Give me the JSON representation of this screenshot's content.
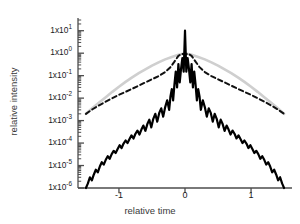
{
  "figure": {
    "background": "#ffffff",
    "axis_color": "#4d4d4d"
  },
  "axes": {
    "xlabel": "relative time",
    "ylabel": "relative intensity",
    "xticks": [
      {
        "value": -1,
        "label": "-1"
      },
      {
        "value": 0,
        "label": "0"
      },
      {
        "value": 1,
        "label": "1"
      }
    ],
    "yticks": [
      {
        "exp": 1,
        "mantissa": "1x10",
        "label": "1x10",
        "sup": "1"
      },
      {
        "exp": 0,
        "mantissa": "1x10",
        "label": "1x10",
        "sup": "0"
      },
      {
        "exp": -1,
        "mantissa": "1x10",
        "label": "1x10",
        "sup": "-1"
      },
      {
        "exp": -2,
        "mantissa": "1x10",
        "label": "1x10",
        "sup": "-2"
      },
      {
        "exp": -3,
        "mantissa": "1x10",
        "label": "1x10",
        "sup": "-3"
      },
      {
        "exp": -4,
        "mantissa": "1x10",
        "label": "1x10",
        "sup": "-4"
      },
      {
        "exp": -5,
        "mantissa": "1x10",
        "label": "1x10",
        "sup": "-5"
      },
      {
        "exp": -6,
        "mantissa": "1x10",
        "label": "1x10",
        "sup": "-6"
      }
    ]
  },
  "chart_data": {
    "type": "line",
    "title": "",
    "xlabel": "relative time",
    "ylabel": "relative intensity",
    "xlim": [
      -1.62,
      1.62
    ],
    "ylim": [
      1e-06,
      30
    ],
    "yscale": "log",
    "xscale": "linear",
    "grid": false,
    "legend": false,
    "series": [
      {
        "name": "gray-envelope",
        "style": "solid",
        "color": "#cfcfcf",
        "width": 2.6,
        "comment": "smooth broad gaussian-like envelope peaking at ~1 near t=0",
        "x": [
          -1.5,
          -1.4,
          -1.3,
          -1.2,
          -1.1,
          -1.0,
          -0.9,
          -0.8,
          -0.7,
          -0.6,
          -0.5,
          -0.4,
          -0.3,
          -0.2,
          -0.1,
          0.0,
          0.1,
          0.2,
          0.3,
          0.4,
          0.5,
          0.6,
          0.7,
          0.8,
          0.9,
          1.0,
          1.1,
          1.2,
          1.3,
          1.4,
          1.5
        ],
        "y": [
          0.002,
          0.0036,
          0.0064,
          0.011,
          0.019,
          0.032,
          0.053,
          0.084,
          0.13,
          0.19,
          0.28,
          0.39,
          0.53,
          0.68,
          0.85,
          1.0,
          0.85,
          0.68,
          0.53,
          0.39,
          0.28,
          0.19,
          0.13,
          0.084,
          0.053,
          0.032,
          0.019,
          0.011,
          0.0064,
          0.0036,
          0.002
        ]
      },
      {
        "name": "dashed-envelope",
        "style": "dashed",
        "color": "#111111",
        "width": 2.0,
        "comment": "dashed curve, flatter in wings than gray, peaks ~1 with a shallow dip at center",
        "x": [
          -1.5,
          -1.4,
          -1.3,
          -1.2,
          -1.1,
          -1.0,
          -0.9,
          -0.8,
          -0.7,
          -0.6,
          -0.5,
          -0.4,
          -0.3,
          -0.22,
          -0.16,
          -0.1,
          -0.05,
          0.0,
          0.05,
          0.1,
          0.16,
          0.22,
          0.3,
          0.4,
          0.5,
          0.6,
          0.7,
          0.8,
          0.9,
          1.0,
          1.1,
          1.2,
          1.3,
          1.4,
          1.5
        ],
        "y": [
          0.002,
          0.0032,
          0.0048,
          0.007,
          0.01,
          0.014,
          0.019,
          0.026,
          0.036,
          0.05,
          0.069,
          0.095,
          0.145,
          0.24,
          0.42,
          0.76,
          0.95,
          0.86,
          0.95,
          0.76,
          0.42,
          0.24,
          0.145,
          0.095,
          0.069,
          0.05,
          0.036,
          0.026,
          0.019,
          0.014,
          0.01,
          0.007,
          0.0048,
          0.0032,
          0.002
        ]
      },
      {
        "name": "measured-pulse",
        "style": "solid",
        "color": "#000000",
        "width": 2.2,
        "comment": "jagged oscillating trace with deep nulls; central spike reaches ~1x10^1",
        "x": [
          -1.5,
          -1.47,
          -1.44,
          -1.41,
          -1.38,
          -1.35,
          -1.32,
          -1.29,
          -1.26,
          -1.23,
          -1.2,
          -1.17,
          -1.14,
          -1.11,
          -1.08,
          -1.05,
          -1.02,
          -0.99,
          -0.96,
          -0.93,
          -0.9,
          -0.87,
          -0.84,
          -0.81,
          -0.78,
          -0.75,
          -0.72,
          -0.69,
          -0.66,
          -0.63,
          -0.6,
          -0.57,
          -0.54,
          -0.51,
          -0.48,
          -0.45,
          -0.42,
          -0.39,
          -0.36,
          -0.33,
          -0.3,
          -0.27,
          -0.24,
          -0.22,
          -0.2,
          -0.18,
          -0.16,
          -0.14,
          -0.12,
          -0.1,
          -0.08,
          -0.06,
          -0.04,
          -0.02,
          0.0,
          0.02,
          0.04,
          0.06,
          0.08,
          0.1,
          0.12,
          0.14,
          0.16,
          0.18,
          0.2,
          0.22,
          0.24,
          0.27,
          0.3,
          0.33,
          0.36,
          0.39,
          0.42,
          0.45,
          0.48,
          0.51,
          0.54,
          0.57,
          0.6,
          0.63,
          0.66,
          0.69,
          0.72,
          0.75,
          0.78,
          0.81,
          0.84,
          0.87,
          0.9,
          0.93,
          0.96,
          0.99,
          1.02,
          1.05,
          1.08,
          1.11,
          1.14,
          1.17,
          1.2,
          1.23,
          1.26,
          1.29,
          1.32,
          1.35,
          1.38,
          1.41,
          1.44,
          1.47,
          1.5
        ],
        "y": [
          1e-06,
          1.6e-06,
          3e-06,
          2.2e-06,
          4e-06,
          6.5e-06,
          5e-06,
          9e-06,
          1.4e-05,
          1.1e-05,
          1.8e-05,
          2.6e-05,
          2e-05,
          3.2e-05,
          4.5e-05,
          3.6e-05,
          5.5e-05,
          8e-05,
          6e-05,
          9.5e-05,
          0.00013,
          0.0001,
          0.00015,
          0.00022,
          0.00016,
          0.00026,
          0.00036,
          0.00024,
          0.0004,
          0.0006,
          0.00035,
          0.0007,
          0.0011,
          0.0005,
          0.0012,
          0.002,
          0.0009,
          0.0022,
          0.0035,
          0.0015,
          0.004,
          0.008,
          0.003,
          0.012,
          0.025,
          0.008,
          0.04,
          0.15,
          0.03,
          0.33,
          0.05,
          0.2,
          0.6,
          0.15,
          10.0,
          0.15,
          0.6,
          0.2,
          0.05,
          0.33,
          0.03,
          0.15,
          0.04,
          0.008,
          0.025,
          0.012,
          0.003,
          0.008,
          0.004,
          0.0015,
          0.0035,
          0.0022,
          0.0009,
          0.002,
          0.0012,
          0.0005,
          0.0011,
          0.0007,
          0.00035,
          0.0006,
          0.0004,
          0.00024,
          0.00036,
          0.00026,
          0.00016,
          0.00022,
          0.00015,
          0.0001,
          0.00013,
          9.5e-05,
          6e-05,
          8e-05,
          5.5e-05,
          3.6e-05,
          4.5e-05,
          3.2e-05,
          2e-05,
          2.6e-05,
          1.8e-05,
          1.1e-05,
          1.4e-05,
          9e-06,
          5e-06,
          6.5e-06,
          4e-06,
          2.2e-06,
          3e-06,
          1.6e-06,
          1e-06
        ]
      }
    ]
  }
}
